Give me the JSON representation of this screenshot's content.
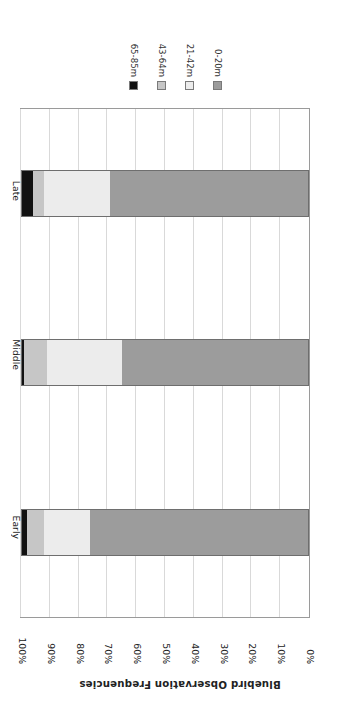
{
  "chart_data": {
    "type": "bar",
    "subtype": "stacked-bar-100-horizontal",
    "title": "",
    "xlabel": "Bluebird Observation Frequencies",
    "ylabel": "",
    "categories": [
      "Early",
      "Middle",
      "Late"
    ],
    "xlim": [
      0,
      100
    ],
    "xtick_labels": [
      "0%",
      "10%",
      "20%",
      "30%",
      "40%",
      "50%",
      "60%",
      "70%",
      "80%",
      "90%",
      "100%"
    ],
    "xtick_values": [
      0,
      10,
      20,
      30,
      40,
      50,
      60,
      70,
      80,
      90,
      100
    ],
    "grid": true,
    "legend_position": "top-right",
    "legend_order": [
      "65-85m",
      "43-64m",
      "21-42m",
      "0-20m"
    ],
    "series": [
      {
        "name": "0-20m",
        "color": "#9c9c9c",
        "values": [
          76,
          65,
          69
        ]
      },
      {
        "name": "21-42m",
        "color": "#ececec",
        "values": [
          16,
          26,
          23
        ]
      },
      {
        "name": "43-64m",
        "color": "#c6c6c6",
        "values": [
          6,
          8,
          4
        ]
      },
      {
        "name": "65-85m",
        "color": "#111111",
        "values": [
          2,
          1,
          4
        ]
      }
    ]
  },
  "axis": {
    "title": "Bluebird Observation Frequencies",
    "ticks": [
      "100%",
      "90%",
      "80%",
      "70%",
      "60%",
      "50%",
      "40%",
      "30%",
      "20%",
      "10%",
      "0%"
    ],
    "category_labels": [
      "Late",
      "Middle",
      "Early"
    ]
  },
  "legend": {
    "items": [
      {
        "label": "65-85m",
        "color": "#111111"
      },
      {
        "label": "43-64m",
        "color": "#c6c6c6"
      },
      {
        "label": "21-42m",
        "color": "#ececec"
      },
      {
        "label": "0-20m",
        "color": "#9c9c9c"
      }
    ]
  },
  "colors": {
    "plot_border": "#9a9a9a",
    "gridline": "#d9d9d9",
    "segment_border": "#6e6e6e",
    "text": "#222222",
    "background": "#ffffff"
  }
}
